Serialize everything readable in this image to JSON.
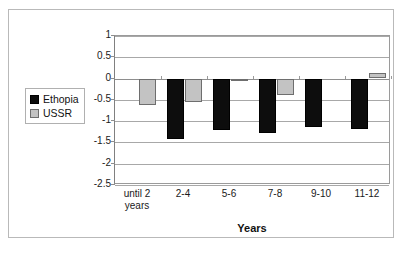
{
  "chart_data": {
    "type": "bar",
    "title": "",
    "subtitle": "",
    "xlabel": "Years",
    "ylabel": "",
    "categories": [
      "until 2 years",
      "2-4",
      "5-6",
      "7-8",
      "9-10",
      "11-12"
    ],
    "series": [
      {
        "name": "Ethopia",
        "color": "#0d0d0d",
        "values": [
          0,
          -1.4,
          -1.2,
          -1.28,
          -1.12,
          -1.17
        ]
      },
      {
        "name": "USSR",
        "color": "#c3c3c3",
        "values": [
          -0.6,
          -0.55,
          -0.05,
          -0.37,
          0,
          0.12
        ]
      }
    ],
    "ylim": [
      -2.5,
      1
    ],
    "ytick_labels": [
      "1",
      "0.5",
      "0",
      "-0.5",
      "-1",
      "-1.5",
      "-2",
      "-2.5"
    ],
    "ytick_values": [
      1,
      0.5,
      0,
      -0.5,
      -1,
      -1.5,
      -2,
      -2.5
    ],
    "grid": true,
    "legend_position": "left-middle",
    "legend_entries": [
      "Ethopia",
      "USSR"
    ]
  },
  "legend": {
    "items": [
      {
        "label": "Ethopia",
        "swatch": "ethiopia"
      },
      {
        "label": "USSR",
        "swatch": "ussr"
      }
    ]
  },
  "axis": {
    "x_title": "Years"
  }
}
